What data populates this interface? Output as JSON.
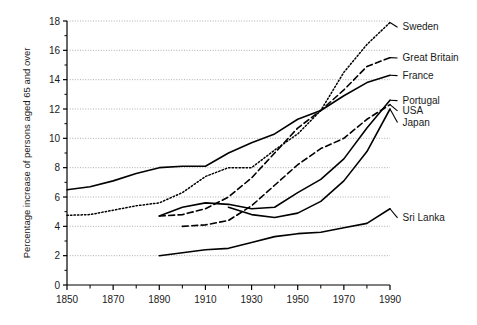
{
  "chart_data": {
    "type": "line",
    "title": "",
    "xlabel": "",
    "ylabel": "Percentage increase of persons aged 65 and over",
    "xlim": [
      1850,
      1990
    ],
    "ylim": [
      0,
      18
    ],
    "xticks": [
      1850,
      1870,
      1890,
      1910,
      1930,
      1950,
      1970,
      1990
    ],
    "xtick_labels": [
      "1850",
      "1870",
      "1890",
      "1910",
      "1930",
      "1950",
      "1970",
      "1990"
    ],
    "xminor_ticks": [
      1860,
      1880,
      1900,
      1920,
      1940,
      1960,
      1980
    ],
    "yticks": [
      0,
      2,
      4,
      6,
      8,
      10,
      12,
      14,
      16,
      18
    ],
    "ytick_labels": [
      "0",
      "2",
      "4",
      "6",
      "8",
      "10",
      "12",
      "14",
      "16",
      "18"
    ],
    "grid": "horizontal-dotted",
    "legend": "right-inline-labels",
    "series": [
      {
        "name": "Sweden",
        "style": "dotted",
        "label": "Sweden",
        "label_x": 1995,
        "label_y": 17.6,
        "points": [
          [
            1850,
            4.75
          ],
          [
            1860,
            4.8
          ],
          [
            1870,
            5.1
          ],
          [
            1880,
            5.4
          ],
          [
            1890,
            5.6
          ],
          [
            1900,
            6.3
          ],
          [
            1910,
            7.4
          ],
          [
            1920,
            8.0
          ],
          [
            1930,
            8.0
          ],
          [
            1940,
            9.2
          ],
          [
            1950,
            10.3
          ],
          [
            1960,
            11.9
          ],
          [
            1970,
            14.5
          ],
          [
            1980,
            16.4
          ],
          [
            1990,
            17.9
          ]
        ]
      },
      {
        "name": "Great Britain",
        "style": "dashed",
        "label": "Great Britain",
        "label_x": 1995,
        "label_y": 15.5,
        "points": [
          [
            1890,
            4.7
          ],
          [
            1900,
            4.8
          ],
          [
            1910,
            5.2
          ],
          [
            1920,
            6.0
          ],
          [
            1930,
            7.3
          ],
          [
            1940,
            9.0
          ],
          [
            1950,
            10.7
          ],
          [
            1960,
            11.9
          ],
          [
            1970,
            13.3
          ],
          [
            1980,
            14.9
          ],
          [
            1990,
            15.5
          ]
        ]
      },
      {
        "name": "France",
        "style": "solid",
        "label": "France",
        "label_x": 1995,
        "label_y": 14.3,
        "points": [
          [
            1850,
            6.5
          ],
          [
            1860,
            6.7
          ],
          [
            1870,
            7.1
          ],
          [
            1880,
            7.6
          ],
          [
            1890,
            8.0
          ],
          [
            1900,
            8.1
          ],
          [
            1910,
            8.1
          ],
          [
            1920,
            9.0
          ],
          [
            1930,
            9.7
          ],
          [
            1940,
            10.3
          ],
          [
            1950,
            11.3
          ],
          [
            1960,
            11.9
          ],
          [
            1970,
            12.9
          ],
          [
            1980,
            13.8
          ],
          [
            1990,
            14.3
          ]
        ]
      },
      {
        "name": "Portugal",
        "style": "solid",
        "label": "Portugal",
        "label_x": 1995,
        "label_y": 12.6,
        "points": [
          [
            1890,
            4.7
          ],
          [
            1900,
            5.3
          ],
          [
            1910,
            5.6
          ],
          [
            1920,
            5.5
          ],
          [
            1930,
            5.2
          ],
          [
            1940,
            5.3
          ],
          [
            1950,
            6.3
          ],
          [
            1960,
            7.2
          ],
          [
            1970,
            8.6
          ],
          [
            1980,
            10.7
          ],
          [
            1990,
            12.6
          ]
        ]
      },
      {
        "name": "USA",
        "style": "dashed",
        "label": "USA",
        "label_x": 1995,
        "label_y": 11.9,
        "points": [
          [
            1900,
            4.0
          ],
          [
            1910,
            4.1
          ],
          [
            1920,
            4.4
          ],
          [
            1930,
            5.4
          ],
          [
            1940,
            6.8
          ],
          [
            1950,
            8.2
          ],
          [
            1960,
            9.3
          ],
          [
            1970,
            10.0
          ],
          [
            1980,
            11.3
          ],
          [
            1990,
            12.3
          ]
        ]
      },
      {
        "name": "Japan",
        "style": "solid",
        "label": "Japan",
        "label_x": 1995,
        "label_y": 11.1,
        "points": [
          [
            1920,
            5.3
          ],
          [
            1930,
            4.8
          ],
          [
            1940,
            4.6
          ],
          [
            1950,
            4.9
          ],
          [
            1960,
            5.7
          ],
          [
            1970,
            7.1
          ],
          [
            1980,
            9.1
          ],
          [
            1990,
            12.0
          ]
        ]
      },
      {
        "name": "Sri Lanka",
        "style": "solid",
        "label": "Sri Lanka",
        "label_x": 1995,
        "label_y": 4.6,
        "points": [
          [
            1890,
            2.0
          ],
          [
            1900,
            2.2
          ],
          [
            1910,
            2.4
          ],
          [
            1920,
            2.5
          ],
          [
            1930,
            2.9
          ],
          [
            1940,
            3.3
          ],
          [
            1950,
            3.5
          ],
          [
            1960,
            3.6
          ],
          [
            1970,
            3.9
          ],
          [
            1980,
            4.2
          ],
          [
            1990,
            5.2
          ]
        ]
      }
    ],
    "colors": {
      "line": "#000000",
      "axis": "#000000",
      "grid": "#999999",
      "background": "#ffffff"
    }
  }
}
